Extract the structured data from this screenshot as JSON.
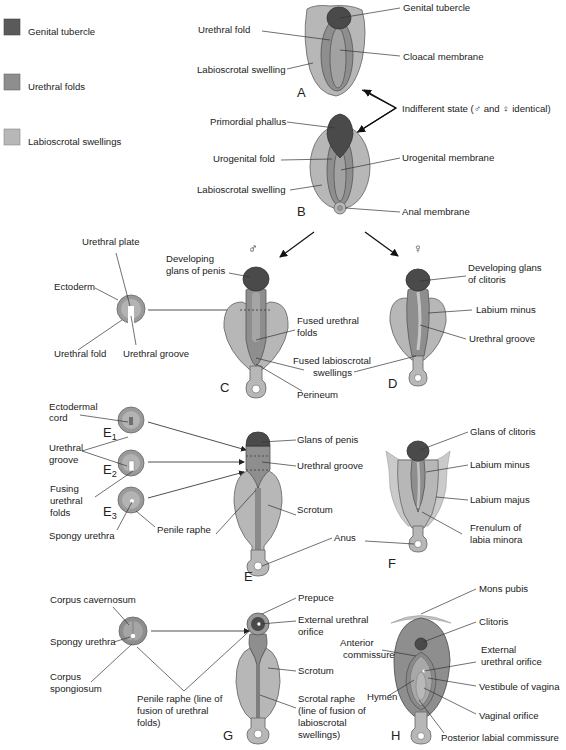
{
  "legend": {
    "items": [
      {
        "label": "Genital tubercle",
        "color": "#5a5a5a"
      },
      {
        "label": "Urethral folds",
        "color": "#8e8e8e"
      },
      {
        "label": "Labioscrotal swellings",
        "color": "#b7b7b7"
      }
    ]
  },
  "stageA": {
    "letter": "A",
    "labels": {
      "genital_tubercle": "Genital tubercle",
      "urethral_fold": "Urethral fold",
      "cloacal_membrane": "Cloacal membrane",
      "labioscrotal_swelling": "Labioscrotal swelling"
    }
  },
  "indifferent": {
    "label": "Indifferent state (♂ and ♀ identical)"
  },
  "stageB": {
    "letter": "B",
    "labels": {
      "primordial_phallus": "Primordial phallus",
      "urogenital_fold": "Urogenital fold",
      "urogenital_membrane": "Urogenital membrane",
      "labioscrotal_swelling": "Labioscrotal swelling",
      "anal_membrane": "Anal membrane"
    }
  },
  "symbols": {
    "male": "♂",
    "female": "♀"
  },
  "stageC": {
    "letter": "C",
    "labels": {
      "urethral_plate": "Urethral plate",
      "ectoderm": "Ectoderm",
      "urethral_fold": "Urethral fold",
      "urethral_groove": "Urethral groove",
      "glans_line1": "Developing",
      "glans_line2": "glans of penis",
      "fused_urethral_1": "Fused urethral",
      "fused_urethral_2": "folds",
      "fused_labio_1": "Fused labioscrotal",
      "fused_labio_2": "swellings",
      "perineum": "Perineum"
    }
  },
  "stageD": {
    "letter": "D",
    "labels": {
      "glans_line1": "Developing glans",
      "glans_line2": "of clitoris",
      "labium_minus": "Labium minus",
      "urethral_groove": "Urethral groove"
    }
  },
  "stageE": {
    "letter": "E",
    "sections": [
      {
        "prefix": "E",
        "sub": "1"
      },
      {
        "prefix": "E",
        "sub": "2"
      },
      {
        "prefix": "E",
        "sub": "3"
      }
    ],
    "labels": {
      "ectodermal_cord_1": "Ectodermal",
      "ectodermal_cord_2": "cord",
      "urethral_groove_1": "Urethral",
      "urethral_groove_2": "groove",
      "fusing_1": "Fusing",
      "fusing_2": "urethral",
      "fusing_3": "folds",
      "spongy_urethra": "Spongy urethra",
      "penile_raphe": "Penile raphe",
      "glans_of_penis": "Glans of penis",
      "urethral_groove": "Urethral groove",
      "scrotum": "Scrotum",
      "anus": "Anus"
    }
  },
  "stageF": {
    "letter": "F",
    "labels": {
      "glans_of_clitoris": "Glans of clitoris",
      "labium_minus": "Labium minus",
      "labium_majus": "Labium majus",
      "frenulum_1": "Frenulum of",
      "frenulum_2": "labia minora"
    }
  },
  "stageG": {
    "letter": "G",
    "labels": {
      "corpus_cavernosum": "Corpus cavernosum",
      "spongy_urethra": "Spongy urethra",
      "corpus_spongiosum_1": "Corpus",
      "corpus_spongiosum_2": "spongiosum",
      "penile_raphe_1": "Penile raphe (line of",
      "penile_raphe_2": "fusion of urethral",
      "penile_raphe_3": "folds)",
      "prepuce": "Prepuce",
      "ext_urethral_1": "External urethral",
      "ext_urethral_2": "orifice",
      "scrotum": "Scrotum",
      "scrotal_raphe_1": "Scrotal raphe",
      "scrotal_raphe_2": "(line of fusion of",
      "scrotal_raphe_3": "labioscrotal",
      "scrotal_raphe_4": "swellings)"
    }
  },
  "stageH": {
    "letter": "H",
    "labels": {
      "mons_pubis": "Mons pubis",
      "clitoris": "Clitoris",
      "anterior_commissure_1": "Anterior",
      "anterior_commissure_2": "commissure",
      "ext_urethral_1": "External",
      "ext_urethral_2": "urethral orifice",
      "vestibule": "Vestibule of vagina",
      "hymen": "Hymen",
      "vaginal_orifice": "Vaginal orifice",
      "posterior_commissure": "Posterior labial commissure"
    }
  }
}
